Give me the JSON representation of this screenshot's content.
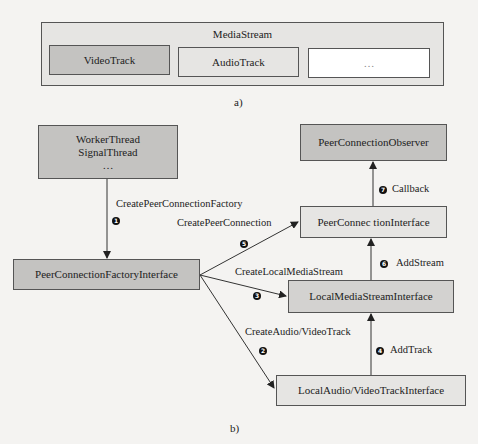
{
  "panel_a": {
    "container": {
      "label": "MediaStream"
    },
    "tracks": [
      {
        "label": "VideoTrack"
      },
      {
        "label": "AudioTrack"
      },
      {
        "label": "…"
      }
    ],
    "caption": "a)"
  },
  "panel_b": {
    "nodes": {
      "threads": {
        "line1": "WorkerThread",
        "line2": "SignalThread",
        "line3": "…"
      },
      "factory": {
        "label": "PeerConnectionFactoryInterface"
      },
      "observer": {
        "label": "PeerConnectionObserver"
      },
      "peer_connection": {
        "label": "PeerConnec tionInterface"
      },
      "local_media_stream": {
        "label": "LocalMediaStreamInterface"
      },
      "local_track": {
        "label": "LocalAudio/VideoTrackInterface"
      }
    },
    "edges": [
      {
        "step": "1",
        "label": "CreatePeerConnectionFactory"
      },
      {
        "step": "2",
        "label": "CreateAudio/VideoTrack"
      },
      {
        "step": "3",
        "label": "CreateLocalMediaStream"
      },
      {
        "step": "4",
        "label": "AddTrack"
      },
      {
        "step": "5",
        "label": "CreatePeerConnection"
      },
      {
        "step": "6",
        "label": "AddStream"
      },
      {
        "step": "7",
        "label": "Callback"
      }
    ],
    "caption": "b)"
  }
}
